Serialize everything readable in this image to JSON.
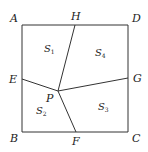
{
  "diagram": {
    "type": "geometry-square-partition",
    "stroke_color": "#333333",
    "points": {
      "A": {
        "label": "A",
        "x": 22,
        "y": 25
      },
      "D": {
        "label": "D",
        "x": 128,
        "y": 25
      },
      "B": {
        "label": "B",
        "x": 22,
        "y": 132
      },
      "C": {
        "label": "C",
        "x": 128,
        "y": 132
      },
      "H": {
        "label": "H",
        "x": 75,
        "y": 25
      },
      "E": {
        "label": "E",
        "x": 22,
        "y": 79
      },
      "G": {
        "label": "G",
        "x": 128,
        "y": 78
      },
      "F": {
        "label": "F",
        "x": 76,
        "y": 132
      },
      "P": {
        "label": "P",
        "x": 58,
        "y": 91
      }
    },
    "segments": [
      "AD",
      "DC",
      "CB",
      "BA",
      "PH",
      "PE",
      "PG",
      "PF"
    ],
    "regions": [
      {
        "name": "S",
        "sub": "1",
        "x": 44,
        "y": 52
      },
      {
        "name": "S",
        "sub": "4",
        "x": 95,
        "y": 56
      },
      {
        "name": "S",
        "sub": "2",
        "x": 36,
        "y": 114
      },
      {
        "name": "S",
        "sub": "3",
        "x": 98,
        "y": 110
      }
    ]
  }
}
